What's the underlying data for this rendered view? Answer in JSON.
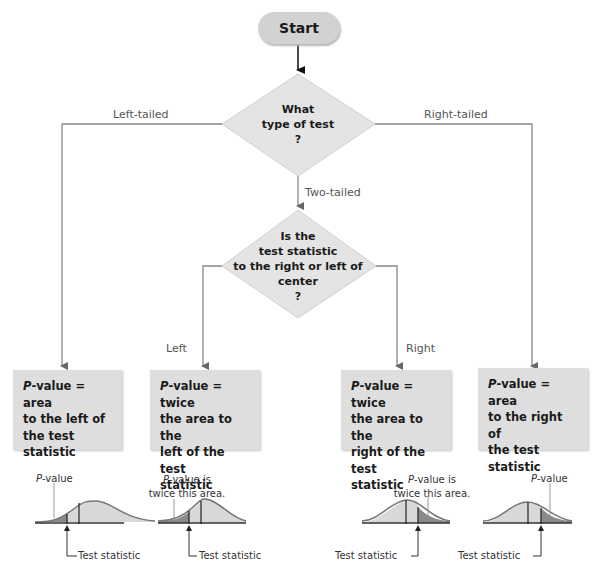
{
  "start": {
    "label": "Start"
  },
  "decision1": {
    "lines": [
      "What",
      "type of test",
      "?"
    ]
  },
  "branches": {
    "left_tailed": "Left-tailed",
    "right_tailed": "Right-tailed",
    "two_tailed": "Two-tailed",
    "left": "Left",
    "right": "Right"
  },
  "decision2": {
    "lines": [
      "Is the",
      "test statistic",
      "to the right or left of",
      "center",
      "?"
    ]
  },
  "boxes": [
    {
      "p": "P",
      "rest1": "-value = area",
      "lines": [
        "to the left of",
        "the test",
        "statistic"
      ]
    },
    {
      "p": "P",
      "rest1": "-value = twice",
      "lines": [
        "the area to the",
        "left of the test",
        "statistic"
      ]
    },
    {
      "p": "P",
      "rest1": "-value = twice",
      "lines": [
        "the area to the",
        "right of the test",
        "statistic"
      ]
    },
    {
      "p": "P",
      "rest1": "-value = area",
      "lines": [
        "to the right of",
        "the test",
        "statistic"
      ]
    }
  ],
  "curves": [
    {
      "top_p": "P",
      "top_rest": "-value",
      "top_line2": "",
      "test_label": "Test statistic"
    },
    {
      "top_p": "P",
      "top_rest": "-value is",
      "top_line2": "twice this area.",
      "test_label": "Test statistic"
    },
    {
      "top_p": "P",
      "top_rest": "-value is",
      "top_line2": "twice this area.",
      "test_label": "Test statistic"
    },
    {
      "top_p": "P",
      "top_rest": "-value",
      "top_line2": "",
      "test_label": "Test statistic"
    }
  ],
  "colors": {
    "box_fill": "#dedede",
    "diamond_fill": "#e4e4e4",
    "line": "#777777",
    "shade_dark": "#8a8a8a",
    "shade_light": "#d6d6d6"
  }
}
